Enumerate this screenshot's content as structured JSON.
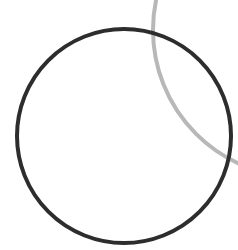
{
  "canvas": {
    "width": 238,
    "height": 250,
    "background": "#ffffff"
  },
  "shapes": {
    "gray_circle": {
      "cx": 300,
      "cy": 30,
      "r": 147,
      "stroke": "#b8b8b8",
      "stroke_width": 4
    },
    "dark_circle": {
      "cx": 124,
      "cy": 136,
      "r": 107,
      "stroke": "#2d2d2d",
      "stroke_width": 4
    }
  }
}
